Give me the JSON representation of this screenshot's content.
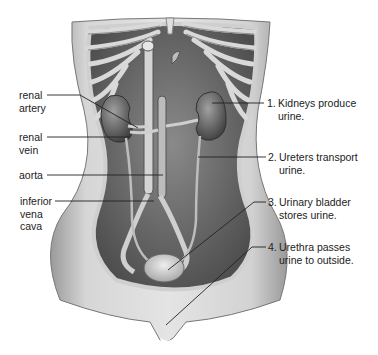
{
  "diagram": {
    "left_labels": [
      {
        "id": "renal-artery",
        "line1": "renal",
        "line2": "artery"
      },
      {
        "id": "renal-vein",
        "line1": "renal",
        "line2": "vein"
      },
      {
        "id": "aorta",
        "line1": "aorta",
        "line2": ""
      },
      {
        "id": "inferior-vena-cava",
        "line1": "inferior",
        "line2": "vena",
        "line3": "cava"
      }
    ],
    "right_labels": [
      {
        "num": "1.",
        "line1": "Kidneys produce",
        "line2": "urine."
      },
      {
        "num": "2.",
        "line1": "Ureters transport",
        "line2": "urine."
      },
      {
        "num": "3.",
        "line1": "Urinary bladder",
        "line2": "stores urine."
      },
      {
        "num": "4.",
        "line1": "Urethra passes",
        "line2": "urine to outside."
      }
    ],
    "colors": {
      "background": "#ffffff",
      "body_skin": "#c9c9c9",
      "cavity": "#6e6e6e",
      "organ": "#5a5a5a",
      "rib": "#d8d8d8",
      "leader_line": "#222222"
    }
  }
}
